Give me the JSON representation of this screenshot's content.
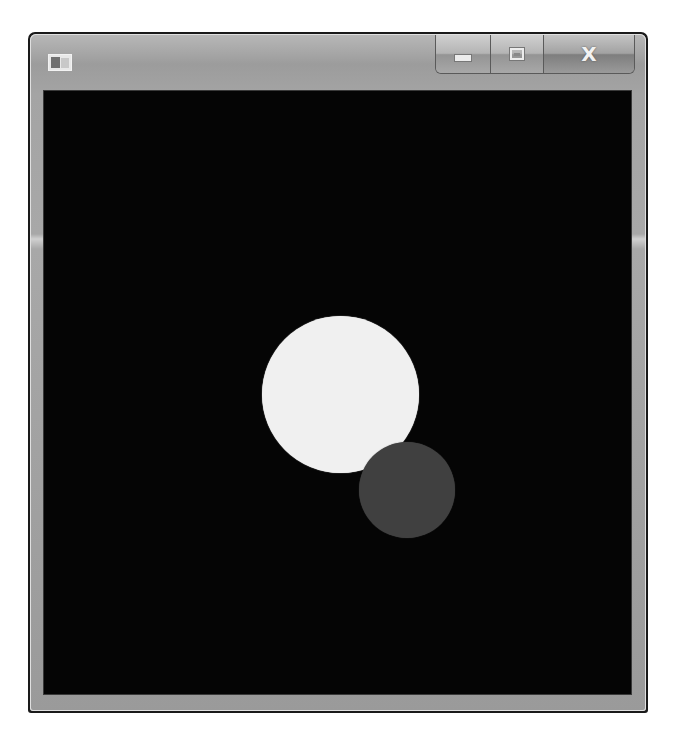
{
  "window": {
    "title": "",
    "icon": "app-icon",
    "controls": {
      "minimize": {
        "icon": "minimize-icon",
        "glyph": ""
      },
      "maximize": {
        "icon": "maximize-icon",
        "glyph": ""
      },
      "close": {
        "icon": "close-icon",
        "glyph": "X"
      }
    }
  },
  "canvas": {
    "background": "#050505",
    "shapes": [
      {
        "type": "circle",
        "name": "large-white-circle",
        "color": "#f0f0f0",
        "cx": 340,
        "cy": 394,
        "diameter": 157
      },
      {
        "type": "circle",
        "name": "small-gray-circle",
        "color": "#404040",
        "cx": 407,
        "cy": 490,
        "diameter": 96
      }
    ]
  }
}
